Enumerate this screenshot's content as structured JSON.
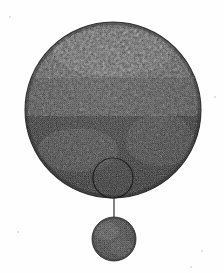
{
  "figure": {
    "domain_label": "scanned-halftone-illustration",
    "canvas": {
      "width": 224,
      "height": 273
    },
    "background_color": "#fefefe",
    "ink_color": "#2b2b2b",
    "texture": "dithered-halftone-grain",
    "caption": "",
    "title": "",
    "shapes": {
      "primary_disc": {
        "name": "large-disc",
        "cx": 113,
        "cy": 110,
        "r": 88,
        "fill_color": "#3a3a3a",
        "dark_patch_color": "#1d1d1d",
        "description": "large textured disc occupying upper portion of frame"
      },
      "inset_outline_circle": {
        "name": "detail-marker-circle",
        "cx": 113,
        "cy": 178,
        "r": 20,
        "stroke_color": "#1a1a1a",
        "stroke_width": 1,
        "fill": "none",
        "description": "thin outlined circle marking a region near lower edge of large disc"
      },
      "leader_line": {
        "name": "leader-line",
        "x1": 114,
        "y1": 196,
        "x2": 114,
        "y2": 218,
        "stroke_color": "#2f2f2f",
        "stroke_width": 1.2
      },
      "secondary_disc": {
        "name": "small-disc",
        "cx": 114,
        "cy": 239,
        "r": 22,
        "fill_color": "#484848",
        "stroke_color": "#3a3a3a",
        "description": "small textured disc below, connected by leader line"
      }
    },
    "stray_marks": [
      {
        "name": "speck-top-left",
        "x": 9,
        "y": 16,
        "size": 2
      },
      {
        "name": "speck-right-edge",
        "x": 214,
        "y": 96,
        "size": 2
      },
      {
        "name": "speck-bottom-right",
        "x": 201,
        "y": 250,
        "size": 2
      },
      {
        "name": "speck-bottom-left",
        "x": 190,
        "y": 266,
        "size": 2
      },
      {
        "name": "speck-lower-left",
        "x": 17,
        "y": 231,
        "size": 2
      }
    ]
  }
}
